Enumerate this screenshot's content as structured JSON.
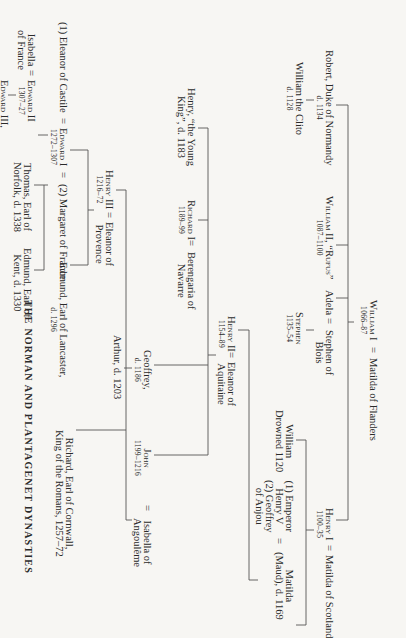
{
  "title": "THE NORMAN AND PLANTAGENET DYNASTIES",
  "eq": "=",
  "persons": {
    "william1": {
      "name": "William I",
      "dates": "1066–87"
    },
    "matilda_flanders": {
      "name": "Matilda of Flanders"
    },
    "robert": {
      "name": "Robert, Duke of Normandy",
      "dates": "d. 1134"
    },
    "william_clito": {
      "name": "William the Clito",
      "dates": "d. 1128"
    },
    "william2": {
      "name": "William II, “Rufus”",
      "dates": "1087–1100"
    },
    "adela": {
      "name": "Adela"
    },
    "stephen_blois": {
      "name": "Stephen of",
      "name2": "Blois"
    },
    "stephen": {
      "name": "Stephen",
      "dates": "1135–54"
    },
    "henry1": {
      "name": "Henry I",
      "dates": "1100–35"
    },
    "matilda_scotland": {
      "name": "Matilda of Scotland"
    },
    "william_drowned": {
      "name": "William",
      "dates": "Drowned 1120"
    },
    "spouses_matilda": {
      "line1": "(1) Emperor",
      "line2": "Henry V",
      "line3": "(2) Geoffrey",
      "line4": "of Anjou"
    },
    "empress_matilda": {
      "name": "Matilda",
      "dates": "(Maud), d. 1169"
    },
    "henry2": {
      "name": "Henry II",
      "dates": "1154–89"
    },
    "eleanor_aquitaine": {
      "name": "Eleanor of",
      "name2": "Aquitaine"
    },
    "henry_young": {
      "name": "Henry, “the Young",
      "name2": "King”, d. 1183"
    },
    "richard1": {
      "name": "Richard I",
      "dates": "1189–99"
    },
    "berengaria": {
      "name": "Berengaria of",
      "name2": "Navarre"
    },
    "geoffrey": {
      "name": "Geoffrey,",
      "dates": "d. 1186"
    },
    "arthur": {
      "name": "Arthur, d. 1203"
    },
    "john": {
      "name": "John",
      "dates": "1199–1216"
    },
    "isabella_angouleme": {
      "name": "Isabella of",
      "name2": "Angoulême"
    },
    "henry3": {
      "name": "Henry III",
      "dates": "1216–72"
    },
    "eleanor_provence": {
      "name": "Eleanor of",
      "name2": "Provence"
    },
    "richard_cornwall": {
      "name": "Richard, Earl of Cornwall,",
      "name2": "King of the Romans, 1257–72"
    },
    "eleanor_castile": {
      "name": "(1) Eleanor of Castile"
    },
    "edward1": {
      "name": "Edward I",
      "dates": "1272–1307"
    },
    "margaret_france": {
      "name": "(2) Margaret of France"
    },
    "edmund_lancaster": {
      "name": "Edmund, Earl of Lancaster,",
      "dates": "d. 1296"
    },
    "isabella_france": {
      "name": "Isabella",
      "name2": "of France"
    },
    "edward2": {
      "name": "Edward II",
      "dates": "1307–27"
    },
    "thomas_norfolk": {
      "name": "Thomas, Earl of",
      "name2": "Norfolk, d. 1338"
    },
    "edmund_kent": {
      "name": "Edmund, Earl of",
      "name2": "Kent, d. 1330"
    },
    "edward3": {
      "name": "Edward III,",
      "dates": "1327–77"
    }
  }
}
